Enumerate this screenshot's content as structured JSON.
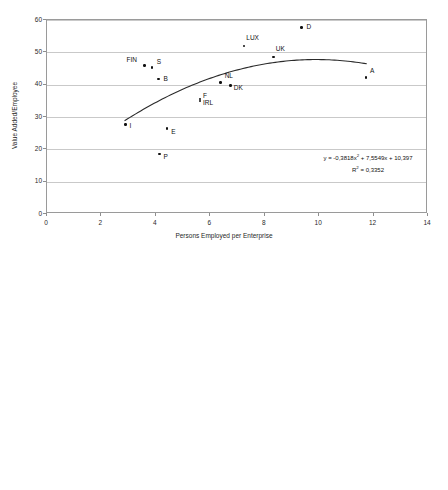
{
  "chart_data": [
    {
      "type": "scatter",
      "title": "",
      "xlabel": "Persons Employed per Enterprise",
      "ylabel": "Value Added/Employee",
      "xlim": [
        0,
        14
      ],
      "ylim": [
        0,
        60
      ],
      "xticks": [
        "0",
        "2",
        "4",
        "6",
        "8",
        "10",
        "12",
        "14"
      ],
      "yticks": [
        "0",
        "10",
        "20",
        "30",
        "40",
        "50",
        "60"
      ],
      "grid": "horizontal",
      "legend": "none",
      "annotation_equation": "y = -0,3818x",
      "annotation_equation_sup": "2",
      "annotation_equation_tail": " + 7,5549x + 10,397",
      "annotation_r2_prefix": "R",
      "annotation_r2_sup": "2",
      "annotation_r2_tail": " = 0,3352",
      "trendline": {
        "type": "quadratic",
        "a": -0.3818,
        "b": 7.5549,
        "c": 10.397,
        "x_from": 2.85,
        "x_to": 11.75
      },
      "points": [
        {
          "label": "I",
          "x": 2.88,
          "y": 27.7,
          "lx": 4,
          "ly": 1
        },
        {
          "label": "FIN",
          "x": 3.58,
          "y": 45.9,
          "lx": -18,
          "ly": -7
        },
        {
          "label": "S",
          "x": 3.85,
          "y": 45.3,
          "lx": 5,
          "ly": -7
        },
        {
          "label": "B",
          "x": 4.1,
          "y": 41.7,
          "lx": 5,
          "ly": -1
        },
        {
          "label": "E",
          "x": 4.42,
          "y": 26.4,
          "lx": 4,
          "ly": 2
        },
        {
          "label": "P",
          "x": 4.13,
          "y": 18.6,
          "lx": 4,
          "ly": 2
        },
        {
          "label": "F",
          "x": 5.62,
          "y": 35.5,
          "lx": 3,
          "ly": -4
        },
        {
          "label": "IRL",
          "x": 5.62,
          "y": 34.9,
          "lx": 3,
          "ly": 1
        },
        {
          "label": "NL",
          "x": 6.38,
          "y": 40.7,
          "lx": 4,
          "ly": -7
        },
        {
          "label": "DK",
          "x": 6.75,
          "y": 39.8,
          "lx": 3,
          "ly": 2
        },
        {
          "label": "LUX",
          "x": 7.25,
          "y": 52.0,
          "lx": 2,
          "ly": -9
        },
        {
          "label": "UK",
          "x": 8.33,
          "y": 48.5,
          "lx": 2,
          "ly": -9
        },
        {
          "label": "D",
          "x": 9.35,
          "y": 57.7,
          "lx": 5,
          "ly": -1
        },
        {
          "label": "A",
          "x": 11.72,
          "y": 42.2,
          "lx": 4,
          "ly": -8
        }
      ]
    },
    {
      "type": "scatter",
      "title": "",
      "xlabel": "Enterprises per 10,000 habitants",
      "ylabel": "Gross operating rate",
      "xlim": [
        0,
        30
      ],
      "ylim": [
        0,
        14
      ],
      "xticks": [
        "0",
        "5",
        "10",
        "15",
        "20",
        "25",
        "30"
      ],
      "yticks": [
        "0",
        "2",
        "4",
        "6",
        "8",
        "10",
        "12",
        "14"
      ],
      "grid": "horizontal",
      "legend": "none",
      "annotation_equation": "y = 0,0288x",
      "annotation_equation_sup": "2",
      "annotation_equation_tail": " - 1,1564x + 15,307",
      "annotation_r2_prefix": "R",
      "annotation_r2_sup": "2",
      "annotation_r2_tail": " = 0,4394",
      "trendline": {
        "type": "quadratic",
        "a": 0.0288,
        "b": -1.1564,
        "c": 15.307,
        "x_from": 6.8,
        "x_to": 27.1
      },
      "points": [
        {
          "label": "D",
          "x": 6.8,
          "y": 12.2,
          "lx": 3,
          "ly": -9
        },
        {
          "label": "A",
          "x": 7.15,
          "y": 4.95,
          "lx": 4,
          "ly": -1
        },
        {
          "label": "UK",
          "x": 10.8,
          "y": 7.6,
          "lx": 3,
          "ly": -8
        },
        {
          "label": "F",
          "x": 12.62,
          "y": 3.05,
          "lx": 2,
          "ly": -4
        },
        {
          "label": "IRL",
          "x": 12.62,
          "y": 2.85,
          "lx": 2,
          "ly": 1
        },
        {
          "label": "NL",
          "x": 13.6,
          "y": 4.35,
          "lx": -14,
          "ly": 2
        },
        {
          "label": "DK",
          "x": 14.95,
          "y": 4.3,
          "lx": -11,
          "ly": 3
        },
        {
          "label": "LUX",
          "x": 14.95,
          "y": 6.05,
          "lx": 2,
          "ly": -9
        },
        {
          "label": "FIN",
          "x": 15.42,
          "y": 4.45,
          "lx": -2,
          "ly": -8
        },
        {
          "label": "E",
          "x": 16.85,
          "y": 4.7,
          "lx": 4,
          "ly": -2
        },
        {
          "label": "B",
          "x": 17.7,
          "y": 3.1,
          "lx": 4,
          "ly": 2
        },
        {
          "label": "S",
          "x": 19.0,
          "y": 3.75,
          "lx": 4,
          "ly": 3
        },
        {
          "label": "I",
          "x": 23.25,
          "y": 6.15,
          "lx": 2,
          "ly": -9
        },
        {
          "label": "P",
          "x": 27.05,
          "y": 4.1,
          "lx": 4,
          "ly": 2
        }
      ]
    }
  ]
}
